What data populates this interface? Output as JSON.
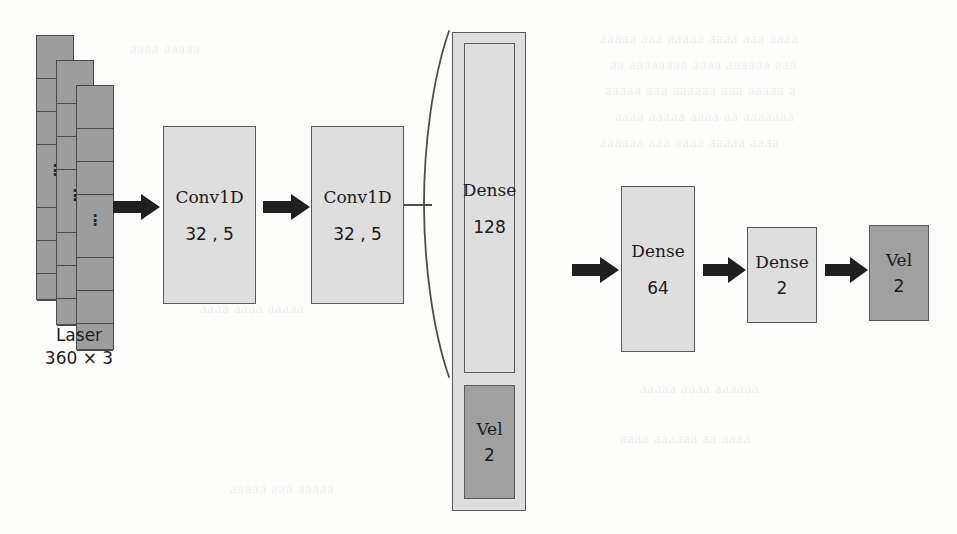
{
  "diagram": {
    "colors": {
      "block_fill": "#dedede",
      "block_fill_dark": "#a0a0a0",
      "block_stroke": "#5a5a5a",
      "laser_fill": "#9d9d9d",
      "laser_stroke": "#4a4a4a",
      "arrow_fill": "#1f1f1f",
      "text": "#1b1b1d",
      "background": "#fdfdfc"
    },
    "input": {
      "name": "laser-input-stack",
      "label_line1": "Laser",
      "label_line2": "360 × 3",
      "channels": 3,
      "ellipsis": "⋮"
    },
    "blocks": [
      {
        "id": "conv1d-1",
        "line1": "Conv1D",
        "line2": "32 , 5",
        "shade": "light"
      },
      {
        "id": "conv1d-2",
        "line1": "Conv1D",
        "line2": "32 , 5",
        "shade": "light"
      },
      {
        "id": "dense-128",
        "line1": "Dense",
        "line2": "128",
        "shade": "light"
      },
      {
        "id": "vel-input",
        "line1": "Vel",
        "line2": "2",
        "shade": "dark"
      },
      {
        "id": "dense-64",
        "line1": "Dense",
        "line2": "64",
        "shade": "light"
      },
      {
        "id": "dense-2",
        "line1": "Dense",
        "line2": "2",
        "shade": "light"
      },
      {
        "id": "vel-output",
        "line1": "Vel",
        "line2": "2",
        "shade": "dark"
      }
    ],
    "arrows": [
      {
        "id": "arrow-input-to-conv1"
      },
      {
        "id": "arrow-conv1-to-conv2"
      },
      {
        "id": "arrow-concat-to-dense64"
      },
      {
        "id": "arrow-dense64-to-dense2"
      },
      {
        "id": "arrow-dense2-to-vel"
      }
    ],
    "bracket": {
      "id": "concat-bracket",
      "glyph": "(",
      "description": "grouping parenthesis joining Dense 128 and Vel 2 inputs"
    }
  }
}
